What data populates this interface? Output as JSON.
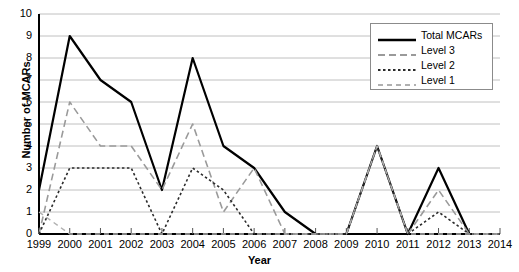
{
  "chart_data": {
    "type": "line",
    "title": "",
    "xlabel": "Year",
    "ylabel": "Number of MCARs",
    "categories": [
      1999,
      2000,
      2001,
      2002,
      2003,
      2004,
      2005,
      2006,
      2007,
      2008,
      2009,
      2010,
      2011,
      2012,
      2013,
      2014
    ],
    "xlim": [
      1999,
      2014
    ],
    "ylim": [
      0,
      10
    ],
    "yticks": [
      0,
      1,
      2,
      3,
      4,
      5,
      6,
      7,
      8,
      9,
      10
    ],
    "grid": "horizontal",
    "legend_position": "top-right",
    "series": [
      {
        "name": "Total MCARs",
        "style": "solid",
        "color": "#000000",
        "width": 2.2,
        "values": [
          2,
          9,
          7,
          6,
          2,
          8,
          4,
          3,
          1,
          0,
          0,
          4,
          0,
          3,
          0,
          0
        ]
      },
      {
        "name": "Level 3",
        "style": "dashed",
        "color": "#9a9a9a",
        "width": 1.6,
        "values": [
          0,
          6,
          4,
          4,
          2,
          5,
          1,
          3,
          0,
          0,
          0,
          4,
          0,
          2,
          0,
          0
        ]
      },
      {
        "name": "Level 2",
        "style": "dotted",
        "color": "#2b2b2b",
        "width": 1.6,
        "values": [
          0,
          3,
          3,
          3,
          0,
          3,
          2,
          0,
          0,
          0,
          0,
          4,
          0,
          1,
          0,
          0
        ]
      },
      {
        "name": "Level 1",
        "style": "dashed-light",
        "color": "#b0b0b0",
        "width": 1.4,
        "values": [
          1,
          0,
          0,
          0,
          0,
          0,
          0,
          0,
          0,
          0,
          0,
          4,
          0,
          0,
          0,
          0
        ]
      }
    ]
  },
  "legend": {
    "entries": [
      {
        "label": "Total MCARs"
      },
      {
        "label": "Level 3"
      },
      {
        "label": "Level 2"
      },
      {
        "label": "Level 1"
      }
    ]
  }
}
